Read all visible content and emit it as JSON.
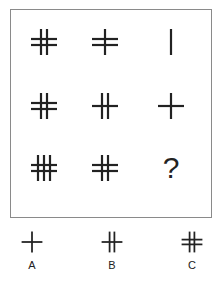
{
  "puzzle": {
    "grid": [
      [
        {
          "v": 2,
          "h": 2
        },
        {
          "v": 1,
          "h": 2
        },
        {
          "v": 1,
          "h": 0
        }
      ],
      [
        {
          "v": 2,
          "h": 2
        },
        {
          "v": 2,
          "h": 1
        },
        {
          "v": 1,
          "h": 1
        }
      ],
      [
        {
          "v": 3,
          "h": 2
        },
        {
          "v": 2,
          "h": 2
        },
        {
          "question": "?"
        }
      ]
    ],
    "question_mark": "?",
    "line_color": "#222222",
    "frame_color": "#8a8a8a"
  },
  "options": [
    {
      "label": "A",
      "v": 1,
      "h": 1
    },
    {
      "label": "B",
      "v": 2,
      "h": 1
    },
    {
      "label": "C",
      "v": 2,
      "h": 2
    }
  ]
}
